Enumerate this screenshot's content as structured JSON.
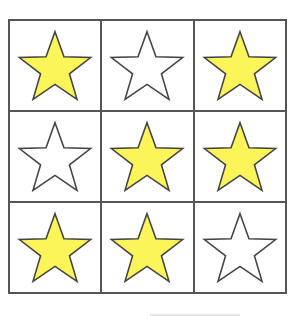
{
  "grid": {
    "rows": 3,
    "cols": 3,
    "line_color": "#555555",
    "cells": [
      {
        "row": 1,
        "col": 1,
        "shape": "star",
        "fill": "yellow",
        "color": "#fbf55a"
      },
      {
        "row": 1,
        "col": 2,
        "shape": "star",
        "fill": "white",
        "color": "#ffffff"
      },
      {
        "row": 1,
        "col": 3,
        "shape": "star",
        "fill": "yellow",
        "color": "#fbf55a"
      },
      {
        "row": 2,
        "col": 1,
        "shape": "star",
        "fill": "white",
        "color": "#ffffff"
      },
      {
        "row": 2,
        "col": 2,
        "shape": "star",
        "fill": "yellow",
        "color": "#fbf55a"
      },
      {
        "row": 2,
        "col": 3,
        "shape": "star",
        "fill": "yellow",
        "color": "#fbf55a"
      },
      {
        "row": 3,
        "col": 1,
        "shape": "star",
        "fill": "yellow",
        "color": "#fbf55a"
      },
      {
        "row": 3,
        "col": 2,
        "shape": "star",
        "fill": "yellow",
        "color": "#fbf55a"
      },
      {
        "row": 3,
        "col": 3,
        "shape": "star",
        "fill": "white",
        "color": "#ffffff"
      }
    ],
    "yellow_count": 6,
    "white_count": 3
  },
  "colors": {
    "star_yellow": "#fbf55a",
    "star_white": "#ffffff",
    "outline": "#444444"
  }
}
